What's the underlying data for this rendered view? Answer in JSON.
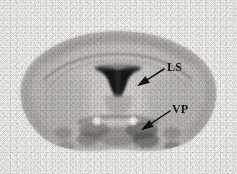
{
  "figure": {
    "kind": "autoradiograph-coronal-brain-section",
    "width": 237,
    "height": 174,
    "background_color": "#f3f2ef",
    "ink_color": "#17171a"
  },
  "annotations": [
    {
      "id": "ls",
      "label": "LS",
      "meaning": "lateral septum",
      "label_x": 167,
      "label_y": 61,
      "arrow": {
        "x1": 164,
        "y1": 69,
        "x2": 139,
        "y2": 85
      }
    },
    {
      "id": "vp",
      "label": "VP",
      "meaning": "ventral pallidum",
      "label_x": 172,
      "label_y": 103,
      "arrow": {
        "x1": 170,
        "y1": 111,
        "x2": 143,
        "y2": 129
      }
    }
  ],
  "structures": {
    "section_outline_label": "coronal brain section",
    "ventricle_label": "lateral ventricles",
    "bright_spots": [
      {
        "id": "spot-left",
        "cx": 97,
        "cy": 121,
        "r": 4.2
      },
      {
        "id": "spot-right",
        "cx": 133,
        "cy": 121,
        "r": 4.2
      }
    ]
  }
}
